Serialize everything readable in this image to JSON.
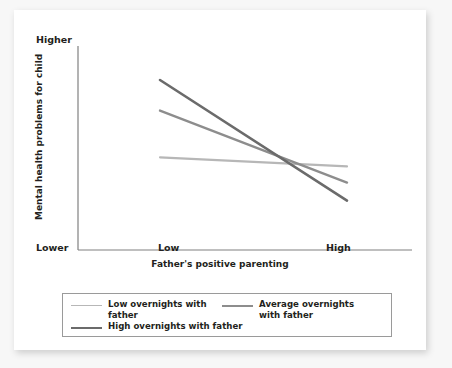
{
  "chart_data": {
    "type": "line",
    "title": "",
    "xlabel": "Father's positive parenting",
    "ylabel": "Mental health problems for child",
    "x_categories": [
      "Low",
      "High"
    ],
    "y_axis_extremes": {
      "top": "Higher",
      "bottom": "Lower"
    },
    "grid": false,
    "legend_position": "bottom",
    "axis_note": "Y axis unlabeled numerically; shows relative magnitude from Lower to Higher",
    "series": [
      {
        "name": "Low overnights with father",
        "color": "#b7b7b7",
        "values": [
          0.47,
          0.42
        ],
        "x": [
          "Low",
          "High"
        ]
      },
      {
        "name": "Average overnights with father",
        "color": "#8d8d8d",
        "values": [
          0.73,
          0.33
        ],
        "x": [
          "Low",
          "High"
        ]
      },
      {
        "name": "High overnights with father",
        "color": "#6b6b6b",
        "values": [
          0.9,
          0.23
        ],
        "x": [
          "Low",
          "High"
        ]
      }
    ]
  },
  "legend": {
    "items": [
      {
        "label": "Low overnights with father",
        "swatch": "thin"
      },
      {
        "label": "Average overnights with father",
        "swatch": "mid"
      },
      {
        "label": "High overnights with father",
        "swatch": "bold"
      }
    ]
  },
  "axes": {
    "y_top": "Higher",
    "y_bottom": "Lower",
    "y_title": "Mental health problems for child",
    "x_title": "Father's positive parenting",
    "x_ticks": [
      "Low",
      "High"
    ]
  }
}
